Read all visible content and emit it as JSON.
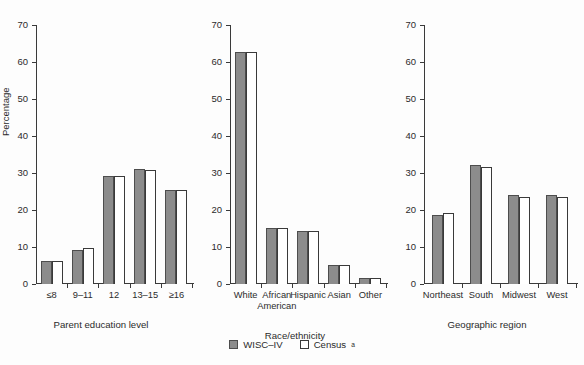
{
  "chart_data": {
    "type": "bar",
    "title": "",
    "ylabel": "Percentage",
    "ylim": [
      0,
      70
    ],
    "yticks": [
      0,
      10,
      20,
      30,
      40,
      50,
      60,
      70
    ],
    "grid": false,
    "legend": {
      "position": "bottom-center",
      "entries": [
        {
          "name": "WISC–IV",
          "color": "#8c8c8c",
          "style": "filled-gray"
        },
        {
          "name": "Census",
          "superscript": "a",
          "color": "#ffffff",
          "style": "white-outline"
        }
      ]
    },
    "panels": [
      {
        "id": "parent-education",
        "xlabel": "Parent education level",
        "categories": [
          "≤8",
          "9–11",
          "12",
          "13–15",
          "≥16"
        ],
        "series": [
          {
            "name": "WISC–IV",
            "values": [
              6.1,
              9.2,
              29.1,
              31.2,
              25.3
            ]
          },
          {
            "name": "Census",
            "values": [
              6.2,
              9.7,
              29.1,
              30.9,
              25.4
            ]
          }
        ]
      },
      {
        "id": "race-ethnicity",
        "xlabel": "Race/ethnicity",
        "categories": [
          "White",
          "African American",
          "Hispanic",
          "Asian",
          "Other"
        ],
        "series": [
          {
            "name": "WISC–IV",
            "values": [
              62.6,
              15.1,
              14.4,
              5.1,
              1.5
            ]
          },
          {
            "name": "Census",
            "values": [
              62.7,
              15.1,
              14.4,
              5.2,
              1.5
            ]
          }
        ]
      },
      {
        "id": "geographic-region",
        "xlabel": "Geographic region",
        "categories": [
          "Northeast",
          "South",
          "Midwest",
          "West"
        ],
        "series": [
          {
            "name": "WISC–IV",
            "values": [
              18.7,
              32.1,
              24.0,
              24.0
            ]
          },
          {
            "name": "Census",
            "values": [
              19.2,
              31.5,
              23.6,
              23.6
            ]
          }
        ]
      }
    ]
  }
}
